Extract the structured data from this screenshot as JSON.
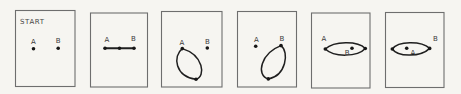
{
  "figure": {
    "colors": {
      "paper": "#f6f5f1",
      "ink": "#1f1f1f",
      "label_text": "#3a3a3a",
      "panel_border": "#6e6e6e"
    },
    "panels": [
      {
        "id": "start",
        "title": "START",
        "label_a": "A",
        "label_b": "B"
      },
      {
        "id": "step-1",
        "label_a": "A",
        "label_b": "B"
      },
      {
        "id": "step-2",
        "label_a": "A",
        "label_b": "B"
      },
      {
        "id": "step-3",
        "label_a": "A",
        "label_b": "B"
      },
      {
        "id": "step-4",
        "label_a": "A",
        "label_b": "B"
      },
      {
        "id": "step-5",
        "label_a": "A",
        "label_b": "B"
      }
    ]
  }
}
